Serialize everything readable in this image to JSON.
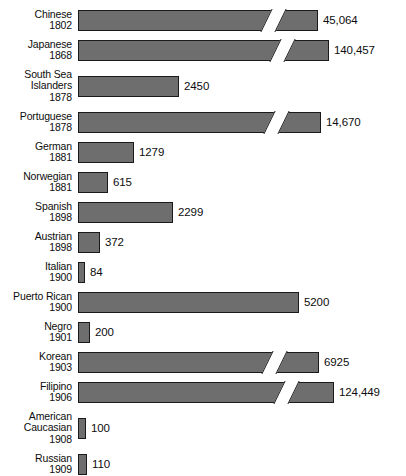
{
  "chart_data": {
    "type": "bar",
    "title": "",
    "subtitle": "",
    "xlabel": "",
    "ylabel": "",
    "orientation": "horizontal",
    "grid": false,
    "legend": null,
    "axis_note": "Bars with a diagonal break mark are drawn to a truncated scale",
    "categories": [
      "Chinese 1802",
      "Japanese 1868",
      "South Sea Islanders 1878",
      "Portuguese 1878",
      "German 1881",
      "Norwegian 1881",
      "Spanish 1898",
      "Austrian 1898",
      "Italian 1900",
      "Puerto Rican 1900",
      "Negro 1901",
      "Korean 1903",
      "Filipino 1906",
      "American Caucasian 1908",
      "Russian 1909"
    ],
    "values": [
      45064,
      140457,
      2450,
      14670,
      1279,
      615,
      2299,
      372,
      84,
      5200,
      200,
      6925,
      124449,
      100,
      110
    ],
    "rows": [
      {
        "name": "Chinese",
        "year": "1802",
        "label": "Chinese\n1802",
        "value": 45064,
        "value_label": "45,064",
        "bar_px": 240,
        "broken": true
      },
      {
        "name": "Japanese",
        "year": "1868",
        "label": "Japanese\n1868",
        "value": 140457,
        "value_label": "140,457",
        "bar_px": 251,
        "broken": true
      },
      {
        "name": "South Sea Islanders",
        "year": "1878",
        "label": "South Sea\nIslanders\n1878",
        "value": 2450,
        "value_label": "2450",
        "bar_px": 101,
        "broken": false
      },
      {
        "name": "Portuguese",
        "year": "1878",
        "label": "Portuguese\n1878",
        "value": 14670,
        "value_label": "14,670",
        "bar_px": 243,
        "broken": true
      },
      {
        "name": "German",
        "year": "1881",
        "label": "German\n1881",
        "value": 1279,
        "value_label": "1279",
        "bar_px": 56,
        "broken": false
      },
      {
        "name": "Norwegian",
        "year": "1881",
        "label": "Norwegian\n1881",
        "value": 615,
        "value_label": "615",
        "bar_px": 30,
        "broken": false
      },
      {
        "name": "Spanish",
        "year": "1898",
        "label": "Spanish\n1898",
        "value": 2299,
        "value_label": "2299",
        "bar_px": 95,
        "broken": false
      },
      {
        "name": "Austrian",
        "year": "1898",
        "label": "Austrian\n1898",
        "value": 372,
        "value_label": "372",
        "bar_px": 22,
        "broken": false
      },
      {
        "name": "Italian",
        "year": "1900",
        "label": "Italian\n1900",
        "value": 84,
        "value_label": "84",
        "bar_px": 7,
        "broken": false
      },
      {
        "name": "Puerto Rican",
        "year": "1900",
        "label": "Puerto Rican\n1900",
        "value": 5200,
        "value_label": "5200",
        "bar_px": 221,
        "broken": false
      },
      {
        "name": "Negro",
        "year": "1901",
        "label": "Negro\n1901",
        "value": 200,
        "value_label": "200",
        "bar_px": 12,
        "broken": false
      },
      {
        "name": "Korean",
        "year": "1903",
        "label": "Korean\n1903",
        "value": 6925,
        "value_label": "6925",
        "bar_px": 241,
        "broken": true
      },
      {
        "name": "Filipino",
        "year": "1906",
        "label": "Filipino\n1906",
        "value": 124449,
        "value_label": "124,449",
        "bar_px": 256,
        "broken": true
      },
      {
        "name": "American Caucasian",
        "year": "1908",
        "label": "American\nCaucasian\n1908",
        "value": 100,
        "value_label": "100",
        "bar_px": 8,
        "broken": false
      },
      {
        "name": "Russian",
        "year": "1909",
        "label": "Russian\n1909",
        "value": 110,
        "value_label": "110",
        "bar_px": 9,
        "broken": false
      }
    ],
    "colors": {
      "bar_fill": "#6e6e6e",
      "bar_stroke": "#1a1a1a",
      "text": "#0d0d0d",
      "background": "#ffffff"
    }
  }
}
